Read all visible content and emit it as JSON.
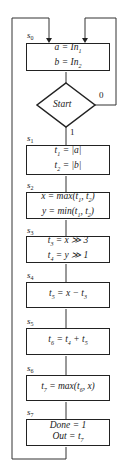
{
  "diagram": {
    "type": "flowchart",
    "states": [
      {
        "id": "s0",
        "label": "s0",
        "lines": [
          "a = In1",
          "b = In2"
        ]
      },
      {
        "id": "start",
        "label": "",
        "decision": "Start",
        "true_label": "1",
        "false_label": "0"
      },
      {
        "id": "s1",
        "label": "s1",
        "lines": [
          "t1 = |a|",
          "t2 = |b|"
        ]
      },
      {
        "id": "s2",
        "label": "s2",
        "lines": [
          "x = max(t1, t2)",
          "y = min(t1, t2)"
        ]
      },
      {
        "id": "s3",
        "label": "s3",
        "lines": [
          "t3 = x >> 3",
          "t4 = y >> 1"
        ]
      },
      {
        "id": "s4",
        "label": "s4",
        "lines": [
          "t5 = x − t3"
        ]
      },
      {
        "id": "s5",
        "label": "s5",
        "lines": [
          "t6 = t4 + t5"
        ]
      },
      {
        "id": "s6",
        "label": "s6",
        "lines": [
          "t7 = max(t6, x)"
        ]
      },
      {
        "id": "s7",
        "label": "s7",
        "lines": [
          "Done = 1",
          "Out = t7"
        ]
      }
    ],
    "edges": [
      {
        "from": "s0",
        "to": "start"
      },
      {
        "from": "start",
        "to": "s1",
        "label": "1"
      },
      {
        "from": "start",
        "to": "s0",
        "label": "0"
      },
      {
        "from": "s1",
        "to": "s2"
      },
      {
        "from": "s2",
        "to": "s3"
      },
      {
        "from": "s3",
        "to": "s4"
      },
      {
        "from": "s4",
        "to": "s5"
      },
      {
        "from": "s5",
        "to": "s6"
      },
      {
        "from": "s6",
        "to": "s7"
      },
      {
        "from": "s7",
        "to": "s0"
      }
    ]
  }
}
